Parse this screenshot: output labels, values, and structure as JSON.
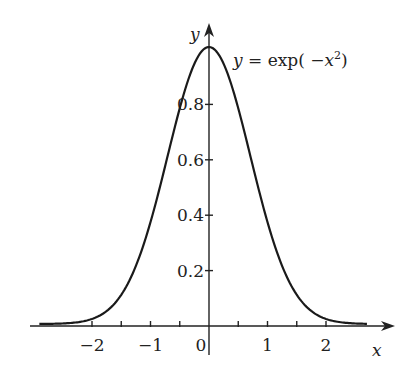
{
  "chart_data": {
    "type": "line",
    "title": "",
    "function_label": {
      "lhs": "y",
      "eq": " = exp( ",
      "neg": "−",
      "var": "x",
      "exp": "2",
      "close": ")"
    },
    "xlabel": "x",
    "ylabel": "y",
    "xlim": [
      -2.9,
      2.7
    ],
    "ylim": [
      0,
      1.0
    ],
    "x_ticks": [
      -2,
      -1,
      0,
      1,
      2
    ],
    "x_tick_labels": [
      "−2",
      "−1",
      "0",
      "1",
      "2"
    ],
    "x_minor_ticks": [
      -1.5,
      -0.5,
      0.5,
      1.5
    ],
    "y_ticks": [
      0.2,
      0.4,
      0.6,
      0.8
    ],
    "y_tick_labels": [
      "0.2",
      "0.4",
      "0.6",
      "0.8"
    ],
    "grid": false,
    "legend": null,
    "series": [
      {
        "name": "y = exp(-x^2)",
        "x": [
          -2.9,
          -2.5,
          -2.0,
          -1.5,
          -1.0,
          -0.5,
          0.0,
          0.5,
          1.0,
          1.5,
          2.0,
          2.5,
          2.7
        ],
        "values": [
          0.0002,
          0.0019,
          0.0183,
          0.1054,
          0.3679,
          0.7788,
          1.0,
          0.7788,
          0.3679,
          0.1054,
          0.0183,
          0.0019,
          0.0007
        ]
      }
    ]
  },
  "layout": {
    "origin_px": [
      209,
      326
    ],
    "x_unit_px": 58.5,
    "y_unit_px": 277,
    "x_axis_px": [
      30,
      395
    ],
    "y_axis_px": [
      355,
      23
    ]
  },
  "colors": {
    "ink": "#1a1a1a",
    "background": "#ffffff"
  }
}
